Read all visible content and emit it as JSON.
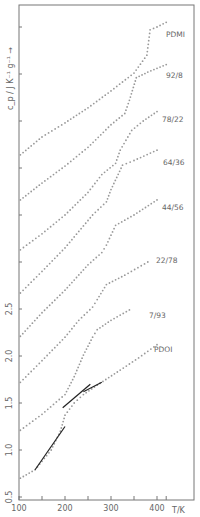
{
  "chart_data": {
    "type": "scatter",
    "title": "",
    "xlabel": "T/K",
    "ylabel": "c_p / J K^-1 g^-1",
    "xlim": [
      100,
      430
    ],
    "ylim": [
      0.4,
      5.7
    ],
    "x_ticks": [
      100,
      200,
      300,
      400
    ],
    "x_tick_labels": [
      "100",
      "200",
      "300",
      "400"
    ],
    "y_ticks": [
      0.5,
      1.0,
      1.5,
      2.0,
      2.5,
      3.0,
      3.5,
      4.0,
      4.5,
      5.0,
      5.5
    ],
    "y_tick_labels": [
      "0.5",
      "1.0",
      "1.5",
      "2.0",
      "2.5",
      "",
      "",
      "",
      "",
      "",
      ""
    ],
    "grid": false,
    "legend_position": "inline-right",
    "note": "Curves are vertically offset; only the lowest tick labels are printed.",
    "series": [
      {
        "name": "PDMI",
        "x": [
          103,
          150,
          200,
          250,
          300,
          350,
          378,
          385,
          400,
          420
        ],
        "y": [
          4.14,
          4.33,
          4.48,
          4.64,
          4.82,
          5.01,
          5.2,
          5.47,
          5.5,
          5.55
        ]
      },
      {
        "name": "92/8",
        "x": [
          103,
          150,
          200,
          250,
          300,
          330,
          340,
          355,
          380,
          420
        ],
        "y": [
          3.66,
          3.84,
          4.02,
          4.22,
          4.46,
          4.58,
          4.72,
          4.96,
          5.02,
          5.1
        ]
      },
      {
        "name": "78/22",
        "x": [
          103,
          150,
          200,
          250,
          280,
          310,
          320,
          345,
          370,
          400
        ],
        "y": [
          3.13,
          3.3,
          3.5,
          3.74,
          3.93,
          4.05,
          4.19,
          4.4,
          4.5,
          4.6
        ]
      },
      {
        "name": "64/36",
        "x": [
          103,
          150,
          200,
          260,
          290,
          300,
          325,
          350,
          400
        ],
        "y": [
          2.67,
          2.9,
          3.15,
          3.5,
          3.64,
          3.77,
          4.03,
          4.08,
          4.19
        ]
      },
      {
        "name": "44/56",
        "x": [
          103,
          150,
          200,
          250,
          280,
          290,
          310,
          350,
          400
        ],
        "y": [
          2.21,
          2.46,
          2.7,
          2.97,
          3.1,
          3.18,
          3.39,
          3.5,
          3.66
        ]
      },
      {
        "name": "22/78",
        "x": [
          103,
          150,
          200,
          230,
          260,
          270,
          290,
          330,
          380
        ],
        "y": [
          1.72,
          1.95,
          2.2,
          2.38,
          2.52,
          2.6,
          2.76,
          2.86,
          3.0
        ]
      },
      {
        "name": "7/93",
        "x": [
          103,
          150,
          200,
          220,
          240,
          260,
          270,
          300,
          340
        ],
        "y": [
          1.21,
          1.38,
          1.59,
          1.78,
          2.01,
          2.2,
          2.28,
          2.38,
          2.49
        ]
      },
      {
        "name": "PDOI",
        "x": [
          103,
          135,
          150,
          170,
          190,
          200,
          220,
          240,
          270,
          320,
          360,
          400
        ],
        "y": [
          0.7,
          0.79,
          0.88,
          1.0,
          1.2,
          1.37,
          1.5,
          1.59,
          1.69,
          1.85,
          1.98,
          2.12
        ]
      }
    ],
    "line_overlays": [
      {
        "name": "PDOI-fit-low",
        "x": [
          135,
          200
        ],
        "y": [
          0.79,
          1.25
        ]
      },
      {
        "name": "PDOI-fit-mid",
        "x": [
          195,
          255
        ],
        "y": [
          1.45,
          1.7
        ]
      },
      {
        "name": "PDOI-fit-high",
        "x": [
          240,
          280
        ],
        "y": [
          1.62,
          1.72
        ]
      }
    ]
  },
  "labels": {
    "x_axis": "T/K",
    "y_axis": "c_p / J K⁻¹ g⁻¹ →",
    "curves": [
      "PDMI",
      "92/8",
      "78/22",
      "64/36",
      "44/56",
      "22/78",
      "7/93",
      "PDOI"
    ]
  },
  "colors": {
    "frame": "#777777",
    "points": "#999999",
    "fit_lines": "#222222",
    "text": "#666666"
  }
}
